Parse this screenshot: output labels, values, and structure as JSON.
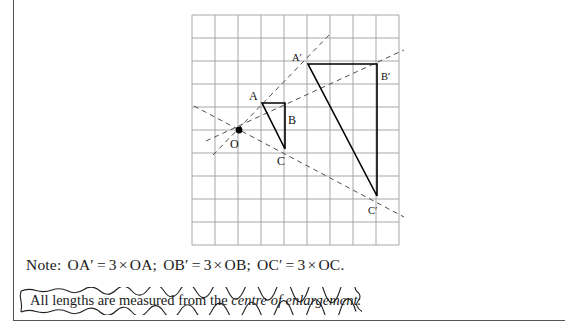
{
  "page": {
    "background": "#ffffff",
    "frame_color": "#555555"
  },
  "figure": {
    "caption": "Enlargement of triangle ABC about centre O with scale factor 3",
    "grid": {
      "spacing_px": 23,
      "color": "#9a9a9a",
      "x_start": 192,
      "y_start": 15,
      "cols": 9,
      "rows": 10
    },
    "centre_label": "O",
    "points": [
      {
        "name": "A",
        "label": "A",
        "x": 262,
        "y": 103,
        "label_x": 252,
        "label_y": 99,
        "label_size": "normal"
      },
      {
        "name": "B",
        "label": "B",
        "x": 285,
        "y": 103,
        "label_x": 289,
        "label_y": 121,
        "label_size": "normal"
      },
      {
        "name": "C",
        "label": "C",
        "x": 285,
        "y": 149,
        "label_x": 279,
        "label_y": 164,
        "label_size": "normal"
      },
      {
        "name": "A'",
        "label": "A'",
        "x": 308,
        "y": 64,
        "label_x": 294,
        "label_y": 61,
        "label_size": "small"
      },
      {
        "name": "B'",
        "label": "B'",
        "x": 377,
        "y": 64,
        "label_x": 381,
        "label_y": 79,
        "label_size": "small"
      },
      {
        "name": "C'",
        "label": "C'",
        "x": 377,
        "y": 196,
        "label_x": 370,
        "label_y": 213,
        "label_size": "small"
      },
      {
        "name": "O",
        "label": "O",
        "x": 239,
        "y": 130,
        "label_x": 231,
        "label_y": 147,
        "label_size": "normal"
      }
    ],
    "triangle_small": "A-B-C",
    "triangle_large": "A'-B'-C'",
    "ray_style": "dashed",
    "ray_color": "#4a4a4a",
    "shape_color": "#000000",
    "rays": [
      {
        "name": "ray-OA",
        "from": "O",
        "through": "A'",
        "x1": 215,
        "y1": 152,
        "x2": 330,
        "y2": 34
      },
      {
        "name": "ray-OB",
        "from": "O",
        "through": "B'",
        "x1": 210,
        "y1": 140,
        "x2": 400,
        "y2": 52
      },
      {
        "name": "ray-OC",
        "from": "O",
        "through": "C'",
        "x1": 196,
        "y1": 108,
        "x2": 400,
        "y2": 215
      }
    ]
  },
  "note": {
    "prefix": "Note:",
    "items": [
      {
        "left": "OA",
        "left_prime": "′",
        "eq": "=",
        "factor": "3",
        "times": "×",
        "right": "OA",
        "sep": ";"
      },
      {
        "left": "OB",
        "left_prime": "′",
        "eq": "=",
        "factor": "3",
        "times": "×",
        "right": "OB",
        "sep": ";"
      },
      {
        "left": "OC",
        "left_prime": "′",
        "eq": "=",
        "factor": "3",
        "times": "×",
        "right": "OC",
        "sep": "."
      }
    ]
  },
  "callout": {
    "text_plain": "All lengths are measured from the ",
    "text_italic": "centre of enlargement.",
    "border_style": "hand-drawn-wavy"
  }
}
